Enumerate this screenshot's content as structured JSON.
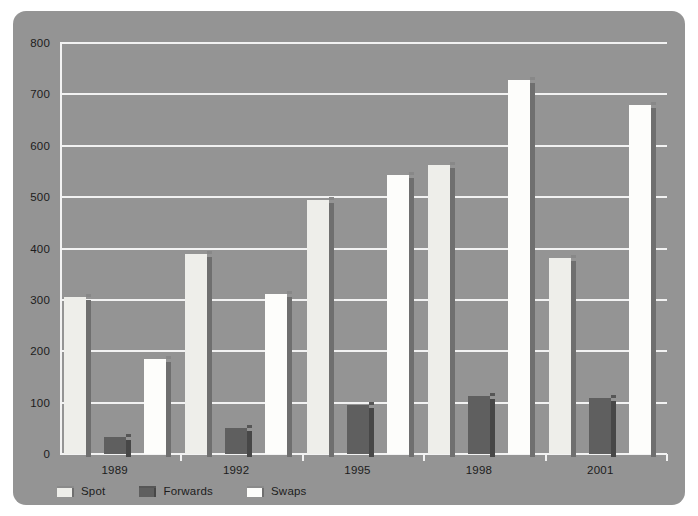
{
  "chart_data": {
    "type": "bar",
    "title": "",
    "subtitle": "",
    "xlabel": "",
    "ylabel": "",
    "categories": [
      "1989",
      "1992",
      "1995",
      "1998",
      "2001"
    ],
    "series": [
      {
        "name": "Spot",
        "values": [
          305,
          390,
          495,
          563,
          382
        ],
        "color": "#eeeeea"
      },
      {
        "name": "Forwards",
        "values": [
          33,
          50,
          95,
          112,
          110
        ],
        "color": "#5f5f5f"
      },
      {
        "name": "Swaps",
        "values": [
          185,
          312,
          543,
          728,
          680
        ],
        "color": "#fdfdfb"
      }
    ],
    "ylim": [
      0,
      800
    ],
    "ytick_values": [
      0,
      100,
      200,
      300,
      400,
      500,
      600,
      700,
      800
    ],
    "ytick_labels": [
      "0",
      "100",
      "200",
      "300",
      "400",
      "500",
      "600",
      "700",
      "800"
    ],
    "grid": true,
    "legend_position": "bottom-left",
    "legend_entries": [
      "Spot",
      "Forwards",
      "Swaps"
    ],
    "panel_background": "#949494",
    "gridline_color": "#f2f2f2",
    "page_background": "#ffffff"
  }
}
